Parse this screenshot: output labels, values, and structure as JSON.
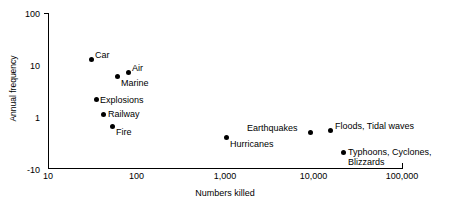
{
  "chart_data": {
    "type": "scatter",
    "title": "",
    "xlabel": "Numbers killed",
    "ylabel": "Annual frequency",
    "xscale": "log",
    "yscale": "log",
    "xlim": [
      10,
      100000
    ],
    "ylim": [
      0.1,
      100
    ],
    "grid": false,
    "legend": "none",
    "x_ticks": [
      "10",
      "100",
      "1,000",
      "10,000",
      "100,000"
    ],
    "x_tick_values": [
      10,
      100,
      1000,
      10000,
      100000
    ],
    "y_ticks": [
      "100",
      "10",
      "1",
      "-10"
    ],
    "y_tick_values": [
      100,
      10,
      1,
      0.1
    ],
    "points": [
      {
        "label": "Car",
        "x": 38,
        "y": 12,
        "px": 91,
        "py": 59,
        "label_dx": 4,
        "label_dy": -9,
        "lines": 1
      },
      {
        "label": "Air",
        "x": 78,
        "y": 6.5,
        "px": 128,
        "py": 72,
        "label_dx": 4,
        "label_dy": -9,
        "lines": 1
      },
      {
        "label": "Marine",
        "x": 66,
        "y": 5.3,
        "px": 117,
        "py": 76,
        "label_dx": 4,
        "label_dy": 2,
        "lines": 1
      },
      {
        "label": "Explosions",
        "x": 43,
        "y": 2.4,
        "px": 96,
        "py": 99,
        "label_dx": 4,
        "label_dy": -4,
        "lines": 1
      },
      {
        "label": "Railway",
        "x": 50,
        "y": 1.2,
        "px": 103,
        "py": 114,
        "label_dx": 5,
        "label_dy": -5,
        "lines": 1
      },
      {
        "label": "Fire",
        "x": 59,
        "y": 0.8,
        "px": 112,
        "py": 126,
        "label_dx": 4,
        "label_dy": 1,
        "lines": 1
      },
      {
        "label": "Hurricanes",
        "x": 1000,
        "y": 0.42,
        "px": 226,
        "py": 137,
        "label_dx": 4,
        "label_dy": 2,
        "lines": 1
      },
      {
        "label": "Earthquakes",
        "x": 11000,
        "y": 0.55,
        "px": 310,
        "py": 132,
        "label_dx": -63,
        "label_dy": -9,
        "lines": 1
      },
      {
        "label": "Floods, Tidal waves",
        "x": 14000,
        "y": 0.58,
        "px": 330,
        "py": 130,
        "label_dx": 5,
        "label_dy": -9,
        "lines": 1
      },
      {
        "label": "Typhoons, Cyclones, Blizzards",
        "x": 22000,
        "y": 0.28,
        "px": 343,
        "py": 152,
        "label_dx": 5,
        "label_dy": -5,
        "lines": 2
      }
    ]
  }
}
